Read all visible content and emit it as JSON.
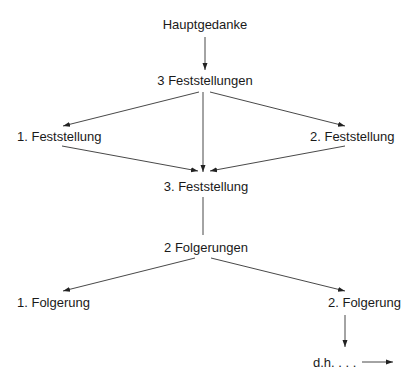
{
  "diagram": {
    "nodes": {
      "main": "Hauptgedanke",
      "findings": "3 Feststellungen",
      "finding1": "1. Feststellung",
      "finding2": "2. Feststellung",
      "finding3": "3. Feststellung",
      "conclusions": "2 Folgerungen",
      "conclusion1": "1. Folgerung",
      "conclusion2": "2. Folgerung",
      "continuation": "d.h. . . ."
    },
    "edges": [
      {
        "from": "Hauptgedanke",
        "to": "3 Feststellungen",
        "arrow": true
      },
      {
        "from": "3 Feststellungen",
        "to": "1. Feststellung",
        "arrow": true
      },
      {
        "from": "3 Feststellungen",
        "to": "2. Feststellung",
        "arrow": true
      },
      {
        "from": "3 Feststellungen",
        "to": "3. Feststellung",
        "arrow": true
      },
      {
        "from": "1. Feststellung",
        "to": "3. Feststellung",
        "arrow": true
      },
      {
        "from": "2. Feststellung",
        "to": "3. Feststellung",
        "arrow": true
      },
      {
        "from": "3. Feststellung",
        "to": "2 Folgerungen",
        "arrow": false
      },
      {
        "from": "2 Folgerungen",
        "to": "1. Folgerung",
        "arrow": true
      },
      {
        "from": "2 Folgerungen",
        "to": "2. Folgerung",
        "arrow": true
      },
      {
        "from": "2. Folgerung",
        "to": "d.h. . . .",
        "arrow": true
      },
      {
        "from": "d.h. . . .",
        "to": "",
        "arrow": true
      }
    ],
    "line_color": "#222222"
  }
}
